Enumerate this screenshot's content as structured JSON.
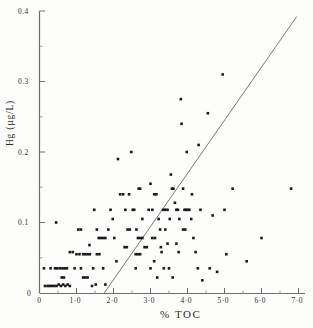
{
  "figure": {
    "name": "scatter-plot-hg-vs-toc",
    "background_color": "#fefefe",
    "ink_color": "#1a1a1a"
  },
  "chart_data": {
    "type": "scatter",
    "title": "",
    "subtitle": "",
    "xlabel": "% TOC",
    "ylabel": "Hg (µg/L)",
    "xlim": [
      0,
      7.0
    ],
    "ylim": [
      0,
      0.4
    ],
    "grid": false,
    "legend": null,
    "xticks": [
      0,
      1.0,
      2.0,
      3.0,
      4.0,
      5.0,
      6.0,
      7.0
    ],
    "xtick_labels": [
      "0",
      "1·0",
      "2·0",
      "3·0",
      "4·0",
      "5·0",
      "6·0",
      "7·0"
    ],
    "x_minor_ticks": [
      0.5,
      1.5,
      2.5,
      3.5,
      4.5,
      5.5,
      6.5
    ],
    "yticks": [
      0,
      0.1,
      0.2,
      0.3,
      0.4
    ],
    "ytick_labels": [
      "0",
      "0.1",
      "0.2",
      "0.3",
      "0.4"
    ],
    "y_minor_ticks": [
      0.05,
      0.15,
      0.25,
      0.35
    ],
    "marker": "square",
    "marker_size": 2.6,
    "marker_color": "#1a1a1a",
    "trendline": {
      "name": "regression-line",
      "color": "#6b6b6b",
      "width": 0.9,
      "x_start": 1.75,
      "y_start": 0.0,
      "x_end": 6.95,
      "y_end": 0.392
    },
    "points": [
      [
        0.12,
        0.035
      ],
      [
        0.15,
        0.01
      ],
      [
        0.22,
        0.01
      ],
      [
        0.28,
        0.01
      ],
      [
        0.34,
        0.01
      ],
      [
        0.4,
        0.01
      ],
      [
        0.46,
        0.01
      ],
      [
        0.52,
        0.012
      ],
      [
        0.58,
        0.01
      ],
      [
        0.64,
        0.012
      ],
      [
        0.7,
        0.01
      ],
      [
        0.76,
        0.012
      ],
      [
        0.82,
        0.01
      ],
      [
        0.55,
        0.035
      ],
      [
        0.62,
        0.035
      ],
      [
        0.68,
        0.035
      ],
      [
        0.74,
        0.035
      ],
      [
        0.6,
        0.022
      ],
      [
        0.66,
        0.022
      ],
      [
        0.42,
        0.035
      ],
      [
        0.48,
        0.035
      ],
      [
        0.3,
        0.035
      ],
      [
        0.45,
        0.1
      ],
      [
        0.82,
        0.058
      ],
      [
        0.9,
        0.058
      ],
      [
        0.95,
        0.035
      ],
      [
        1.0,
        0.055
      ],
      [
        1.08,
        0.055
      ],
      [
        1.12,
        0.035
      ],
      [
        1.18,
        0.022
      ],
      [
        1.24,
        0.022
      ],
      [
        1.3,
        0.022
      ],
      [
        1.05,
        0.09
      ],
      [
        1.12,
        0.09
      ],
      [
        1.18,
        0.055
      ],
      [
        1.24,
        0.055
      ],
      [
        1.3,
        0.055
      ],
      [
        1.36,
        0.055
      ],
      [
        1.42,
        0.01
      ],
      [
        1.35,
        0.068
      ],
      [
        1.48,
        0.118
      ],
      [
        1.55,
        0.09
      ],
      [
        1.6,
        0.078
      ],
      [
        1.66,
        0.078
      ],
      [
        1.72,
        0.078
      ],
      [
        1.78,
        0.078
      ],
      [
        1.55,
        0.055
      ],
      [
        1.62,
        0.055
      ],
      [
        1.45,
        0.035
      ],
      [
        1.52,
        0.012
      ],
      [
        1.72,
        0.035
      ],
      [
        1.78,
        0.012
      ],
      [
        1.86,
        0.09
      ],
      [
        1.92,
        0.118
      ],
      [
        1.98,
        0.105
      ],
      [
        2.02,
        0.078
      ],
      [
        2.08,
        0.045
      ],
      [
        2.12,
        0.19
      ],
      [
        2.18,
        0.14
      ],
      [
        2.26,
        0.14
      ],
      [
        2.32,
        0.118
      ],
      [
        2.38,
        0.09
      ],
      [
        2.44,
        0.09
      ],
      [
        2.3,
        0.065
      ],
      [
        2.36,
        0.065
      ],
      [
        2.42,
        0.14
      ],
      [
        2.48,
        0.2
      ],
      [
        2.52,
        0.118
      ],
      [
        2.56,
        0.118
      ],
      [
        2.62,
        0.09
      ],
      [
        2.68,
        0.148
      ],
      [
        2.72,
        0.148
      ],
      [
        2.78,
        0.105
      ],
      [
        2.66,
        0.078
      ],
      [
        2.72,
        0.078
      ],
      [
        2.78,
        0.078
      ],
      [
        2.6,
        0.055
      ],
      [
        2.66,
        0.055
      ],
      [
        2.72,
        0.055
      ],
      [
        2.84,
        0.065
      ],
      [
        2.9,
        0.065
      ],
      [
        2.6,
        0.035
      ],
      [
        2.95,
        0.118
      ],
      [
        3.0,
        0.155
      ],
      [
        3.05,
        0.118
      ],
      [
        3.1,
        0.14
      ],
      [
        3.16,
        0.14
      ],
      [
        3.22,
        0.105
      ],
      [
        3.26,
        0.09
      ],
      [
        3.05,
        0.078
      ],
      [
        3.12,
        0.078
      ],
      [
        3.0,
        0.035
      ],
      [
        3.1,
        0.045
      ],
      [
        3.18,
        0.022
      ],
      [
        3.28,
        0.065
      ],
      [
        3.34,
        0.118
      ],
      [
        3.4,
        0.118
      ],
      [
        3.46,
        0.118
      ],
      [
        3.52,
        0.105
      ],
      [
        3.4,
        0.09
      ],
      [
        3.46,
        0.07
      ],
      [
        3.3,
        0.058
      ],
      [
        3.36,
        0.035
      ],
      [
        3.5,
        0.035
      ],
      [
        3.55,
        0.168
      ],
      [
        3.58,
        0.148
      ],
      [
        3.62,
        0.148
      ],
      [
        3.66,
        0.128
      ],
      [
        3.7,
        0.118
      ],
      [
        3.74,
        0.118
      ],
      [
        3.78,
        0.105
      ],
      [
        3.82,
        0.275
      ],
      [
        3.84,
        0.24
      ],
      [
        3.88,
        0.148
      ],
      [
        3.92,
        0.118
      ],
      [
        3.96,
        0.118
      ],
      [
        4.0,
        0.118
      ],
      [
        3.88,
        0.09
      ],
      [
        3.94,
        0.09
      ],
      [
        3.7,
        0.07
      ],
      [
        3.76,
        0.058
      ],
      [
        3.6,
        0.022
      ],
      [
        3.98,
        0.2
      ],
      [
        4.05,
        0.118
      ],
      [
        4.1,
        0.105
      ],
      [
        4.16,
        0.078
      ],
      [
        4.22,
        0.058
      ],
      [
        4.28,
        0.035
      ],
      [
        4.12,
        0.14
      ],
      [
        4.3,
        0.21
      ],
      [
        4.35,
        0.118
      ],
      [
        4.4,
        0.018
      ],
      [
        4.55,
        0.255
      ],
      [
        4.6,
        0.035
      ],
      [
        4.68,
        0.11
      ],
      [
        4.8,
        0.03
      ],
      [
        4.95,
        0.31
      ],
      [
        5.0,
        0.118
      ],
      [
        5.05,
        0.055
      ],
      [
        5.22,
        0.148
      ],
      [
        5.6,
        0.045
      ],
      [
        6.0,
        0.078
      ],
      [
        6.8,
        0.148
      ]
    ]
  }
}
